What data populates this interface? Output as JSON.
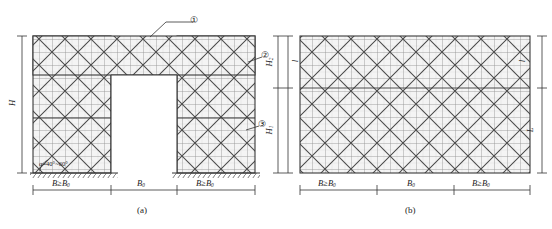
{
  "figure": {
    "title_a": "(a)",
    "title_b": "(b)",
    "type": "engineering-elevation-diagram"
  },
  "panel_a": {
    "caption": "(a)",
    "callouts": [
      {
        "id": "1",
        "glyph": "①",
        "target": "top chord / horizontal diagonal bracing layer"
      },
      {
        "id": "2",
        "glyph": "②",
        "target": "upper vertical bracing zone"
      },
      {
        "id": "3",
        "glyph": "③",
        "target": "lower vertical bracing zone"
      }
    ],
    "angle_note": "α=40°~60°",
    "vertical_dims": [
      {
        "label": "H",
        "symbol": "H",
        "subscript": "",
        "position": "left-outer",
        "meaning": "total height"
      },
      {
        "label": "H2",
        "symbol": "H",
        "subscript": "2",
        "position": "right-upper",
        "meaning": "upper zone height"
      },
      {
        "label": "H1",
        "symbol": "H",
        "subscript": "1",
        "position": "right-lower",
        "meaning": "lower zone height"
      }
    ],
    "horizontal_dims": [
      {
        "label": "B ≥ B0",
        "symbol": "B",
        "relation": "≥",
        "ref": "B",
        "ref_sub": "0",
        "segment": "left tower width"
      },
      {
        "label": "B0",
        "symbol": "B",
        "subscript": "0",
        "segment": "opening width"
      },
      {
        "label": "B ≥ B0",
        "symbol": "B",
        "relation": "≥",
        "ref": "B",
        "ref_sub": "0",
        "segment": "right tower width"
      }
    ],
    "ground_line": "hatched ground / support line"
  },
  "panel_b": {
    "caption": "(b)",
    "vertical_dims": [
      {
        "label": "l",
        "symbol": "l",
        "position": "left-upper",
        "meaning": "bay height"
      },
      {
        "label": "l",
        "symbol": "l",
        "position": "right-upper",
        "meaning": "bay height"
      },
      {
        "label": "L",
        "symbol": "L",
        "position": "right-lower",
        "meaning": "total elevation length"
      }
    ],
    "horizontal_dims": [
      {
        "label": "B ≥ B0",
        "symbol": "B",
        "relation": "≥",
        "ref": "B",
        "ref_sub": "0",
        "segment": "left bay"
      },
      {
        "label": "B0",
        "symbol": "B",
        "subscript": "0",
        "segment": "middle bay"
      },
      {
        "label": "B ≥ B0",
        "symbol": "B",
        "relation": "≥",
        "ref": "B",
        "ref_sub": "0",
        "segment": "right bay"
      }
    ]
  },
  "colors": {
    "line": "#3a3a3a",
    "grid_light": "#b9b9b9",
    "brace": "#444444",
    "fill": "#f2f2f2",
    "dim": "#333333",
    "background": "#ffffff"
  }
}
